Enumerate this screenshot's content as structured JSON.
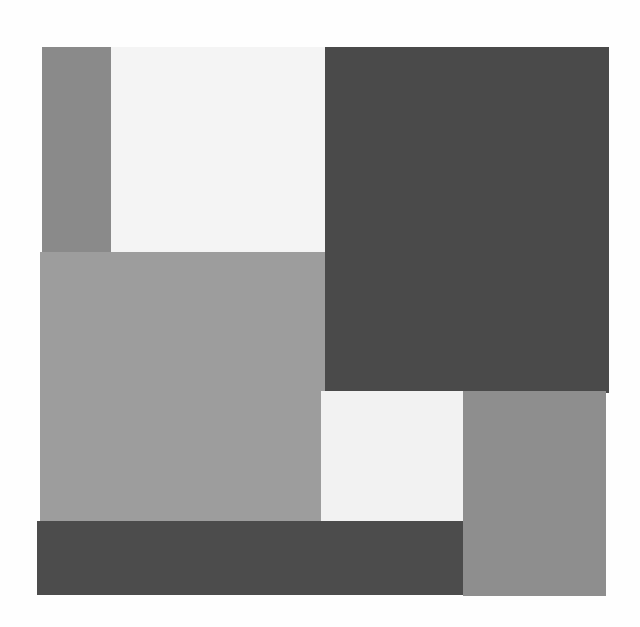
{
  "artwork": {
    "description": "Abstract grayscale composition of rectangles",
    "background": "#fefefe",
    "blocks": [
      {
        "name": "left-gray-strip",
        "x": 42,
        "y": 47,
        "w": 70,
        "h": 206,
        "color": "#8a8a8a"
      },
      {
        "name": "top-white-block",
        "x": 111,
        "y": 47,
        "w": 214,
        "h": 206,
        "color": "#f4f4f4"
      },
      {
        "name": "top-right-dark-block",
        "x": 325,
        "y": 47,
        "w": 284,
        "h": 346,
        "color": "#4a4a4a"
      },
      {
        "name": "center-gray-block",
        "x": 40,
        "y": 252,
        "w": 285,
        "h": 270,
        "color": "#9d9d9d"
      },
      {
        "name": "small-white-block",
        "x": 321,
        "y": 391,
        "w": 142,
        "h": 133,
        "color": "#f2f2f2"
      },
      {
        "name": "bottom-right-gray-block",
        "x": 463,
        "y": 391,
        "w": 143,
        "h": 205,
        "color": "#8e8e8e"
      },
      {
        "name": "bottom-dark-strip",
        "x": 37,
        "y": 521,
        "w": 426,
        "h": 74,
        "color": "#4c4c4c"
      }
    ]
  }
}
